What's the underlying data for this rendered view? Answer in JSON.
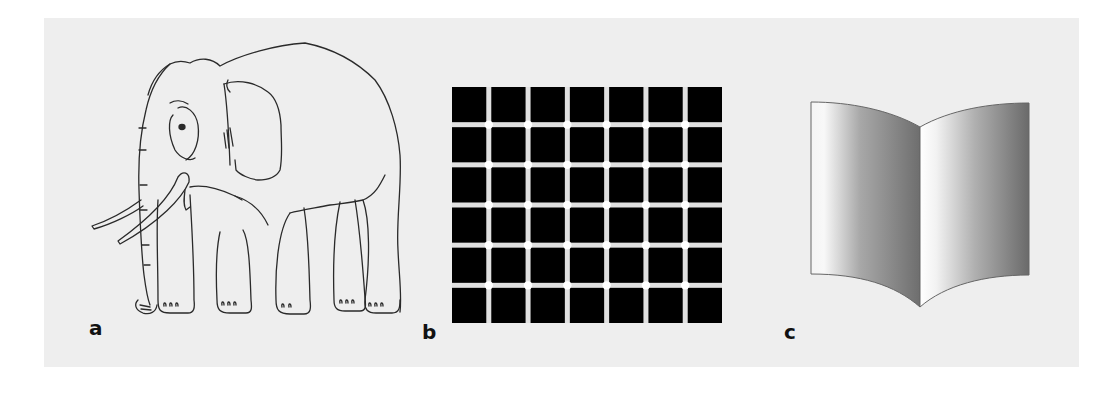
{
  "figure": {
    "panels": [
      {
        "id": "a",
        "label": "a",
        "content": "line drawing of an elephant (impossible-legs illusion)"
      },
      {
        "id": "b",
        "label": "b",
        "content": "scintillating grid illusion"
      },
      {
        "id": "c",
        "label": "c",
        "content": "ambiguous open book (Mach book illusion)"
      }
    ],
    "grid": {
      "columns": 7,
      "rows": 6,
      "cell_color": "#000000",
      "line_color": "#e0e0e0",
      "dot_color": "#ffffff"
    },
    "colors": {
      "background": "#eeeeee",
      "ink": "#222222"
    }
  }
}
